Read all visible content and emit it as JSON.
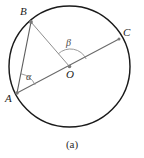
{
  "figure": {
    "caption": "(a)",
    "type": "circle-geometry-diagram",
    "colors": {
      "circle_stroke": "#1a1a1a",
      "chord_stroke": "#5a5a5a",
      "radius_stroke": "#8a8a8a",
      "arc_marker_stroke": "#8a8a8a",
      "point_fill": "#7a7a7a",
      "label_text": "#1c1c1c",
      "angle_text": "#4a4a4a",
      "background": "#ffffff"
    },
    "circle": {
      "center_x": 69.5,
      "center_y": 66.5,
      "radius": 60.5,
      "stroke_width": 1.4
    },
    "points": [
      {
        "id": "B",
        "label": "B",
        "x": 31,
        "y": 22,
        "label_x": 20,
        "label_y": 6
      },
      {
        "id": "C",
        "label": "C",
        "x": 119,
        "y": 39,
        "label_x": 123,
        "label_y": 27
      },
      {
        "id": "O",
        "label": "O",
        "x": 69.5,
        "y": 66.5,
        "label_x": 66,
        "label_y": 69
      },
      {
        "id": "A",
        "label": "A",
        "x": 17,
        "y": 93,
        "label_x": 5,
        "label_y": 93
      }
    ],
    "segments": [
      {
        "id": "AB",
        "from": "A",
        "to": "B",
        "role": "chord",
        "x1": 17,
        "y1": 93,
        "x2": 31,
        "y2": 22
      },
      {
        "id": "AC",
        "from": "A",
        "to": "C",
        "role": "diameter",
        "x1": 17,
        "y1": 93,
        "x2": 119,
        "y2": 39
      },
      {
        "id": "BO",
        "from": "B",
        "to": "O",
        "role": "radius",
        "x1": 31,
        "y1": 22,
        "x2": 69.5,
        "y2": 66.5
      }
    ],
    "angles": [
      {
        "id": "alpha",
        "symbol": "α",
        "vertex": "A",
        "between": [
          "AB",
          "AC"
        ],
        "kind": "inscribed",
        "label_x": 26,
        "label_y": 72
      },
      {
        "id": "beta",
        "symbol": "β",
        "vertex": "O",
        "between": [
          "OB",
          "OC"
        ],
        "kind": "central",
        "label_x": 66,
        "label_y": 38
      }
    ]
  }
}
